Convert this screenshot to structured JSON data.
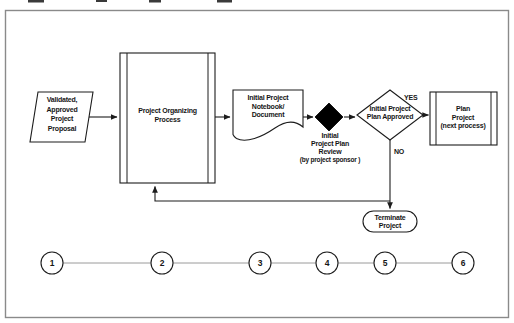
{
  "figure": {
    "type": "flowchart-with-milestone-timeline"
  },
  "flowchart": {
    "proposal": {
      "lines": [
        "Validated,",
        "Approved",
        "Project",
        "Proposal"
      ]
    },
    "organizing": {
      "lines": [
        "Project Organizing",
        "Process"
      ]
    },
    "notebook": {
      "lines": [
        "Initial Project",
        "Notebook/",
        "Document"
      ]
    },
    "review_milestone": {
      "lines": [
        "Initial",
        "Project Plan",
        "Review",
        "(by project sponsor )"
      ]
    },
    "decision": {
      "lines": [
        "Initial Project",
        "Plan Approved"
      ]
    },
    "decision_yes_label": "YES",
    "decision_no_label": "NO",
    "plan_project": {
      "lines": [
        "Plan",
        "Project",
        "(next process)"
      ]
    },
    "terminate": {
      "lines": [
        "Terminate",
        "Project"
      ]
    }
  },
  "timeline": {
    "milestones": [
      "1",
      "2",
      "3",
      "4",
      "5",
      "6"
    ]
  },
  "colors": {
    "line": "#1c1c1c",
    "ink": "#161616",
    "frame": "#8a8a8a",
    "timeline": "#9a9a9a",
    "milestone": "#000000"
  }
}
